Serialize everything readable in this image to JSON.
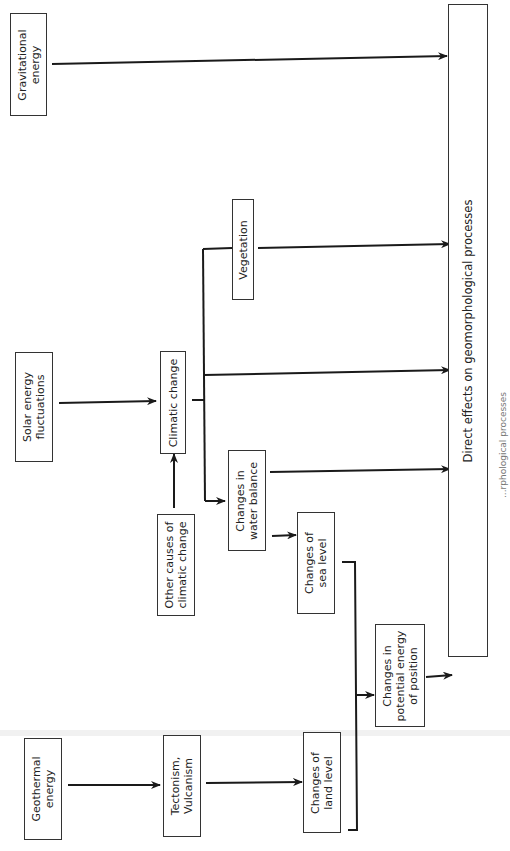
{
  "diagram": {
    "orientation": "rotated-90-ccw",
    "nodes": {
      "gravitational": "Gravitational\nenergy",
      "solar": "Solar energy\nfluctuations",
      "geothermal": "Geothermal\nenergy",
      "tectonism": "Tectonism,\nVulcanism",
      "land_level": "Changes of\nland level",
      "other_causes": "Other causes of\nclimatic change",
      "climatic": "Climatic change",
      "vegetation": "Vegetation",
      "water_balance": "Changes in\nwater balance",
      "sea_level": "Changes of\nsea level",
      "potential_energy": "Changes in\npotential energy\nof position",
      "direct_effects": "Direct effects on geomorphological processes"
    },
    "caption": "...rphological processes",
    "edges": [
      [
        "Gravitational energy",
        "Direct effects on geomorphological processes"
      ],
      [
        "Solar energy fluctuations",
        "Climatic change"
      ],
      [
        "Other causes of climatic change",
        "Climatic change"
      ],
      [
        "Climatic change",
        "Vegetation"
      ],
      [
        "Climatic change",
        "Direct effects on geomorphological processes"
      ],
      [
        "Climatic change",
        "Changes in water balance"
      ],
      [
        "Vegetation",
        "Direct effects on geomorphological processes"
      ],
      [
        "Changes in water balance",
        "Direct effects on geomorphological processes"
      ],
      [
        "Changes in water balance",
        "Changes of sea level"
      ],
      [
        "Changes of sea level",
        "Changes in potential energy of position"
      ],
      [
        "Geothermal energy",
        "Tectonism, Vulcanism"
      ],
      [
        "Tectonism, Vulcanism",
        "Changes of land level"
      ],
      [
        "Changes of land level",
        "Changes in potential energy of position"
      ],
      [
        "Changes in potential energy of position",
        "Direct effects on geomorphological processes"
      ]
    ],
    "colors": {
      "line": "#1a1a1a",
      "box_border": "#333333",
      "background": "#ffffff"
    }
  }
}
